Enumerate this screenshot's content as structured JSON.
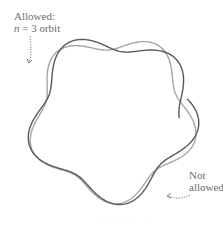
{
  "labels": {
    "allowed_line1": "Allowed:",
    "allowed_n": "n",
    "allowed_line2_rest": " = 3 orbit",
    "not_allowed_line1": "Not",
    "not_allowed_line2": "allowed",
    "caption": "· · ·  · · · · · ·  · · · ·"
  },
  "colors": {
    "allowed_curve": "#a6a6a6",
    "not_allowed_curve": "#5a5a5a",
    "text": "#6e6e6e",
    "arrow": "#7a7a7a"
  },
  "geometry": {
    "center": [
      112,
      118
    ],
    "allowed": {
      "radius": 77,
      "amplitude": 9,
      "waves": 5,
      "phase": 0.3,
      "turns": 1
    },
    "not_allowed": {
      "radius": 77,
      "amplitude": 10,
      "waves": 4.6,
      "phase": 1.2,
      "start_angle": -0.25,
      "turns": 1.04
    }
  }
}
